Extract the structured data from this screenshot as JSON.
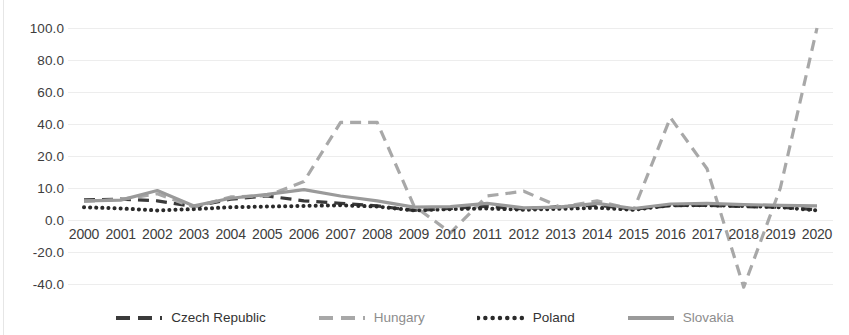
{
  "chart_data": {
    "type": "line",
    "title": "",
    "xlabel": "",
    "ylabel": "",
    "grid": true,
    "legend_position": "bottom",
    "axis_note": "non-linear y-axis: tick values 100,80,60,40,20,10,0,-20,-40 are evenly spaced",
    "y_ticks": [
      "100.0",
      "80.0",
      "60.0",
      "40.0",
      "20.0",
      "10.0",
      "0.0",
      "-20.0",
      "-40.0"
    ],
    "y_tick_values": [
      100,
      80,
      60,
      40,
      20,
      10,
      0,
      -20,
      -40
    ],
    "ylim": [
      -40,
      100
    ],
    "categories": [
      "2000",
      "2001",
      "2002",
      "2003",
      "2004",
      "2005",
      "2006",
      "2007",
      "2008",
      "2009",
      "2010",
      "2011",
      "2012",
      "2013",
      "2014",
      "2015",
      "2016",
      "2017",
      "2018",
      "2019",
      "2020"
    ],
    "series": [
      {
        "name": "Czech Republic",
        "color": "#3a3a3a",
        "style": "dashed",
        "values": [
          6.3,
          6.5,
          6.0,
          4.2,
          6.5,
          7.5,
          6.0,
          5.2,
          4.4,
          3.0,
          3.6,
          4.3,
          3.5,
          4.2,
          4.6,
          3.4,
          4.5,
          4.6,
          4.2,
          4.0,
          3.2
        ]
      },
      {
        "name": "Hungary",
        "color": "#a8a8a8",
        "style": "dashed",
        "values": [
          5.8,
          6.4,
          8.2,
          4.0,
          7.2,
          7.6,
          12.0,
          41.0,
          41.0,
          4.5,
          -8.0,
          7.5,
          9.0,
          4.0,
          6.0,
          3.2,
          44.0,
          16.0,
          -42.0,
          10.0,
          100.0
        ]
      },
      {
        "name": "Poland",
        "color": "#2a2a2a",
        "style": "dotted",
        "values": [
          4.0,
          3.6,
          3.0,
          3.4,
          4.0,
          4.2,
          4.4,
          4.6,
          4.2,
          3.0,
          3.4,
          3.6,
          3.2,
          3.5,
          3.8,
          3.2,
          4.6,
          4.6,
          4.4,
          4.0,
          3.0
        ]
      },
      {
        "name": "Slovakia",
        "color": "#9a9a9a",
        "style": "solid",
        "values": [
          6.0,
          6.2,
          9.2,
          4.4,
          6.8,
          8.0,
          9.5,
          7.5,
          6.0,
          4.0,
          4.2,
          5.2,
          3.8,
          4.0,
          5.2,
          3.6,
          5.0,
          5.2,
          4.8,
          4.6,
          4.4
        ]
      }
    ]
  },
  "legend": {
    "items": [
      {
        "label": "Czech Republic"
      },
      {
        "label": "Hungary"
      },
      {
        "label": "Poland"
      },
      {
        "label": "Slovakia"
      }
    ]
  }
}
